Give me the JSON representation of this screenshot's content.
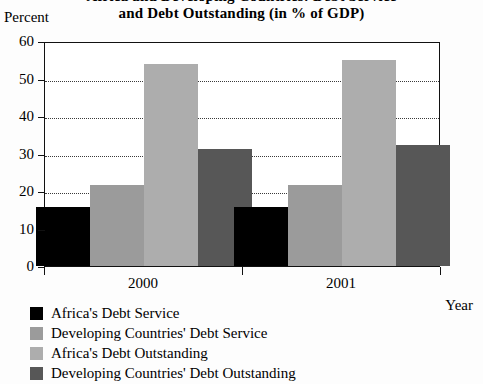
{
  "title": {
    "line1": "Africa and Developing Countries: Debt Service",
    "line2": "and Debt Outstanding (in % of GDP)"
  },
  "axes": {
    "y_unit_label": "Percent",
    "x_title": "Year"
  },
  "chart_data": {
    "type": "bar",
    "title": "Africa and Developing Countries: Debt Service and Debt Outstanding (in % of GDP)",
    "xlabel": "Year",
    "ylabel": "Percent",
    "ylim": [
      0,
      60
    ],
    "yticks": [
      0,
      10,
      20,
      30,
      40,
      50,
      60
    ],
    "ytick_labels": [
      "0",
      "10",
      "20",
      "30",
      "40",
      "50",
      "60"
    ],
    "grid": true,
    "grid_style": "dotted-horizontal",
    "legend_position": "below-left",
    "categories": [
      "2000",
      "2001"
    ],
    "series": [
      {
        "name": "Africa's Debt Service",
        "values": [
          15.8,
          15.8
        ],
        "color": "#000000"
      },
      {
        "name": "Developing Countries' Debt Service",
        "values": [
          21.6,
          21.6
        ],
        "color": "#9b9b9b"
      },
      {
        "name": "Africa's Debt Outstanding",
        "values": [
          53.8,
          54.9
        ],
        "color": "#adadad"
      },
      {
        "name": "Developing Countries' Debt Outstanding",
        "values": [
          31.1,
          32.2
        ],
        "color": "#575757"
      }
    ]
  }
}
